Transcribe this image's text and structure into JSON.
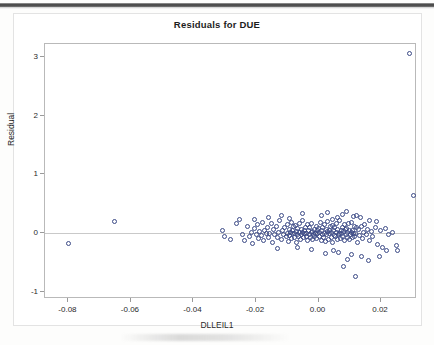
{
  "chart_data": {
    "type": "scatter",
    "title": "Residuals for DUE",
    "xlabel": "DLLEIL1",
    "ylabel": "Residual",
    "xlim": [
      -0.0875,
      0.0315
    ],
    "ylim": [
      -1.12,
      3.22
    ],
    "xticks": [
      "-0.08",
      "-0.06",
      "-0.04",
      "-0.02",
      "0.00",
      "0.02"
    ],
    "xtick_values": [
      -0.08,
      -0.06,
      -0.04,
      -0.02,
      0.0,
      0.02
    ],
    "yticks": [
      "3",
      "2",
      "1",
      "0",
      "-1"
    ],
    "ytick_values": [
      3,
      2,
      1,
      0,
      -1
    ],
    "grid": false,
    "legend": false,
    "reference_line_y": 0,
    "marker": "open-circle",
    "marker_color": "#3c4a86",
    "points": [
      [
        -0.08,
        -0.18
      ],
      [
        -0.0652,
        0.2
      ],
      [
        -0.0308,
        0.04
      ],
      [
        -0.03,
        -0.06
      ],
      [
        -0.0282,
        -0.1
      ],
      [
        -0.0262,
        0.17
      ],
      [
        -0.0252,
        0.23
      ],
      [
        -0.0243,
        -0.02
      ],
      [
        -0.0236,
        -0.13
      ],
      [
        -0.0228,
        0.11
      ],
      [
        -0.0222,
        -0.05
      ],
      [
        -0.0216,
        0.02
      ],
      [
        -0.021,
        -0.17
      ],
      [
        -0.0205,
        0.08
      ],
      [
        -0.02,
        -0.02
      ],
      [
        -0.0196,
        0.14
      ],
      [
        -0.0192,
        -0.09
      ],
      [
        -0.0188,
        0.03
      ],
      [
        -0.0184,
        -0.04
      ],
      [
        -0.018,
        0.19
      ],
      [
        -0.0176,
        -0.12
      ],
      [
        -0.0172,
        0.05
      ],
      [
        -0.0168,
        -0.01
      ],
      [
        -0.0164,
        0.1
      ],
      [
        -0.016,
        -0.07
      ],
      [
        -0.0156,
        0.0
      ],
      [
        -0.0152,
        0.16
      ],
      [
        -0.0148,
        -0.15
      ],
      [
        -0.0144,
        0.06
      ],
      [
        -0.014,
        -0.03
      ],
      [
        -0.0136,
        0.12
      ],
      [
        -0.0132,
        -0.08
      ],
      [
        -0.0128,
        0.01
      ],
      [
        -0.0124,
        0.21
      ],
      [
        -0.012,
        -0.11
      ],
      [
        -0.0116,
        0.04
      ],
      [
        -0.0112,
        -0.02
      ],
      [
        -0.0108,
        0.09
      ],
      [
        -0.0104,
        -0.06
      ],
      [
        -0.01,
        0.0
      ],
      [
        -0.0098,
        0.15
      ],
      [
        -0.0096,
        -0.14
      ],
      [
        -0.0094,
        0.07
      ],
      [
        -0.0092,
        -0.04
      ],
      [
        -0.009,
        0.02
      ],
      [
        -0.0088,
        0.18
      ],
      [
        -0.0086,
        -0.09
      ],
      [
        -0.0084,
        0.05
      ],
      [
        -0.0082,
        -0.01
      ],
      [
        -0.008,
        0.11
      ],
      [
        -0.0078,
        -0.07
      ],
      [
        -0.0076,
        0.0
      ],
      [
        -0.0074,
        0.13
      ],
      [
        -0.0072,
        -0.16
      ],
      [
        -0.007,
        0.03
      ],
      [
        -0.0068,
        -0.03
      ],
      [
        -0.0066,
        0.08
      ],
      [
        -0.0064,
        -0.05
      ],
      [
        -0.0062,
        0.01
      ],
      [
        -0.006,
        0.17
      ],
      [
        -0.0058,
        -0.1
      ],
      [
        -0.0056,
        0.06
      ],
      [
        -0.0054,
        -0.02
      ],
      [
        -0.0052,
        0.02
      ],
      [
        -0.005,
        0.22
      ],
      [
        -0.0048,
        -0.08
      ],
      [
        -0.0046,
        0.04
      ],
      [
        -0.0044,
        -0.01
      ],
      [
        -0.0042,
        0.1
      ],
      [
        -0.004,
        -0.06
      ],
      [
        -0.0038,
        0.0
      ],
      [
        -0.0036,
        0.14
      ],
      [
        -0.0034,
        -0.13
      ],
      [
        -0.0032,
        0.05
      ],
      [
        -0.003,
        -0.03
      ],
      [
        -0.0028,
        0.09
      ],
      [
        -0.0026,
        -0.07
      ],
      [
        -0.0024,
        0.01
      ],
      [
        -0.0022,
        0.16
      ],
      [
        -0.002,
        -0.11
      ],
      [
        -0.0018,
        0.03
      ],
      [
        -0.0016,
        -0.02
      ],
      [
        -0.0014,
        0.07
      ],
      [
        -0.0012,
        -0.05
      ],
      [
        -0.001,
        0.0
      ],
      [
        -0.0008,
        0.12
      ],
      [
        -0.0006,
        -0.09
      ],
      [
        -0.0004,
        0.04
      ],
      [
        -0.0002,
        -0.01
      ],
      [
        0.0,
        0.08
      ],
      [
        0.0002,
        -0.06
      ],
      [
        0.0004,
        0.02
      ],
      [
        0.0006,
        0.18
      ],
      [
        0.0008,
        -0.12
      ],
      [
        0.001,
        0.05
      ],
      [
        0.0012,
        -0.03
      ],
      [
        0.0014,
        0.1
      ],
      [
        0.0016,
        -0.08
      ],
      [
        0.0018,
        0.0
      ],
      [
        0.002,
        0.15
      ],
      [
        0.0022,
        -0.14
      ],
      [
        0.0024,
        0.06
      ],
      [
        0.0026,
        -0.02
      ],
      [
        0.0028,
        0.03
      ],
      [
        0.003,
        0.2
      ],
      [
        0.0032,
        -0.1
      ],
      [
        0.0034,
        0.04
      ],
      [
        0.0036,
        -0.01
      ],
      [
        0.0038,
        0.11
      ],
      [
        0.004,
        -0.07
      ],
      [
        0.0042,
        0.01
      ],
      [
        0.0044,
        0.13
      ],
      [
        0.0046,
        -0.15
      ],
      [
        0.0048,
        0.05
      ],
      [
        0.005,
        -0.04
      ],
      [
        0.0052,
        0.09
      ],
      [
        0.0054,
        -0.06
      ],
      [
        0.0056,
        0.02
      ],
      [
        0.0058,
        0.17
      ],
      [
        0.006,
        -0.11
      ],
      [
        0.0062,
        0.07
      ],
      [
        0.0064,
        -0.02
      ],
      [
        0.0066,
        0.0
      ],
      [
        0.0068,
        0.21
      ],
      [
        0.007,
        -0.09
      ],
      [
        0.0072,
        0.04
      ],
      [
        0.0074,
        -0.01
      ],
      [
        0.0076,
        0.1
      ],
      [
        0.0078,
        -0.05
      ],
      [
        0.008,
        0.03
      ],
      [
        0.0082,
        0.14
      ],
      [
        0.0084,
        -0.13
      ],
      [
        0.0086,
        0.06
      ],
      [
        0.0088,
        -0.03
      ],
      [
        0.009,
        0.08
      ],
      [
        0.0092,
        -0.07
      ],
      [
        0.0094,
        0.01
      ],
      [
        0.0096,
        0.16
      ],
      [
        0.0098,
        -0.1
      ],
      [
        0.01,
        0.05
      ],
      [
        0.0102,
        -0.02
      ],
      [
        0.0104,
        0.02
      ],
      [
        0.0106,
        0.19
      ],
      [
        0.0108,
        -0.08
      ],
      [
        0.011,
        0.04
      ],
      [
        0.0112,
        -0.01
      ],
      [
        0.0114,
        0.12
      ],
      [
        0.0116,
        -0.06
      ],
      [
        0.0118,
        0.0
      ],
      [
        0.012,
        0.09
      ],
      [
        0.0124,
        -0.16
      ],
      [
        0.0128,
        0.06
      ],
      [
        0.0132,
        -0.04
      ],
      [
        0.0136,
        0.11
      ],
      [
        0.014,
        -0.09
      ],
      [
        0.0144,
        0.02
      ],
      [
        0.0148,
        0.15
      ],
      [
        0.0152,
        -0.02
      ],
      [
        0.0156,
        0.07
      ],
      [
        0.0162,
        -0.12
      ],
      [
        0.0168,
        0.03
      ],
      [
        0.0174,
        -0.05
      ],
      [
        0.0182,
        0.1
      ],
      [
        0.019,
        -0.19
      ],
      [
        0.0198,
        0.05
      ],
      [
        0.0206,
        -0.24
      ],
      [
        0.0214,
        0.08
      ],
      [
        0.0224,
        -0.02
      ],
      [
        0.0238,
        0.01
      ],
      [
        0.0252,
        -0.3
      ],
      [
        -0.012,
        0.3
      ],
      [
        -0.005,
        0.33
      ],
      [
        0.001,
        0.3
      ],
      [
        0.006,
        0.27
      ],
      [
        0.009,
        0.37
      ],
      [
        0.0112,
        0.28
      ],
      [
        0.0134,
        0.26
      ],
      [
        0.0046,
        0.24
      ],
      [
        0.0078,
        0.31
      ],
      [
        -0.016,
        0.26
      ],
      [
        -0.0094,
        0.25
      ],
      [
        0.003,
        0.35
      ],
      [
        0.0122,
        0.3
      ],
      [
        -0.0204,
        0.24
      ],
      [
        0.0164,
        0.22
      ],
      [
        0.0184,
        0.2
      ],
      [
        0.0022,
        -0.34
      ],
      [
        0.0064,
        -0.33
      ],
      [
        0.0104,
        -0.36
      ],
      [
        0.0136,
        -0.4
      ],
      [
        0.016,
        -0.47
      ],
      [
        0.0092,
        -0.44
      ],
      [
        0.0048,
        -0.29
      ],
      [
        -0.0024,
        -0.27
      ],
      [
        -0.0068,
        -0.25
      ],
      [
        -0.0132,
        -0.26
      ],
      [
        0.008,
        -0.56
      ],
      [
        0.0118,
        -0.74
      ],
      [
        0.0196,
        -0.39
      ],
      [
        0.0218,
        -0.3
      ],
      [
        0.0248,
        -0.21
      ],
      [
        0.029,
        3.05
      ],
      [
        0.0303,
        0.65
      ]
    ]
  }
}
